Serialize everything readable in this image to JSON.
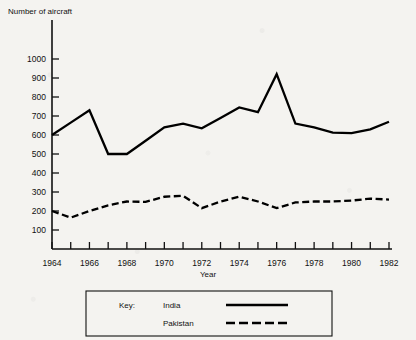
{
  "chart_data": {
    "type": "line",
    "title": "",
    "ylabel": "Number of aircraft",
    "xlabel": "Year",
    "xlim": [
      1964,
      1982
    ],
    "ylim": [
      0,
      1050
    ],
    "grid": false,
    "legend_position": "bottom",
    "legend_title": "Key:",
    "y_ticks": [
      100,
      200,
      300,
      400,
      500,
      600,
      700,
      800,
      900,
      1000
    ],
    "x_ticks": [
      1964,
      1966,
      1968,
      1970,
      1972,
      1974,
      1976,
      1978,
      1980,
      1982
    ],
    "x_tick_labels": [
      "1964",
      "1966",
      "1968",
      "1970",
      "1972",
      "1974",
      "1976",
      "1978",
      "1980",
      "1982"
    ],
    "x": [
      1964,
      1965,
      1966,
      1967,
      1968,
      1969,
      1970,
      1971,
      1972,
      1973,
      1974,
      1975,
      1976,
      1977,
      1978,
      1979,
      1980,
      1981,
      1982
    ],
    "series": [
      {
        "name": "India",
        "style": "solid",
        "color": "#000000",
        "values": [
          600,
          665,
          730,
          500,
          500,
          570,
          640,
          660,
          635,
          690,
          745,
          720,
          920,
          660,
          640,
          612,
          610,
          630,
          670
        ]
      },
      {
        "name": "Pakistan",
        "style": "dashed",
        "color": "#000000",
        "values": [
          200,
          165,
          200,
          230,
          250,
          248,
          275,
          280,
          215,
          250,
          275,
          250,
          215,
          245,
          250,
          250,
          255,
          265,
          260
        ]
      }
    ]
  },
  "legend": {
    "key_label": "Key:",
    "entries": [
      {
        "label": "India",
        "style": "solid"
      },
      {
        "label": "Pakistan",
        "style": "dashed"
      }
    ]
  }
}
